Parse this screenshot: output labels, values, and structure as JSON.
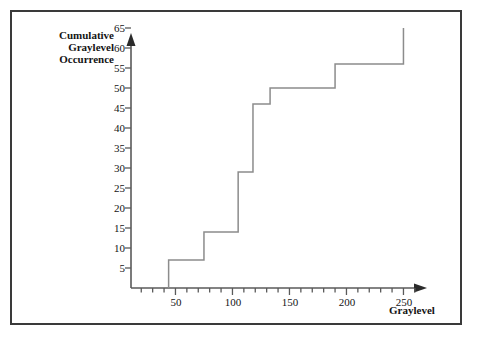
{
  "chart_data": {
    "type": "line",
    "subtype": "step-post",
    "title": "",
    "xlabel": "Graylevel",
    "ylabel": "Cumulative Graylevel Occurrence",
    "ylabel_lines": [
      "Cumulative",
      "Graylevel",
      "Occurrence"
    ],
    "xlim": [
      11,
      265
    ],
    "ylim": [
      0,
      67
    ],
    "x_major_ticks": [
      50,
      100,
      150,
      200,
      250
    ],
    "x_major_tick_labels": [
      "50",
      "100",
      "150",
      "200",
      "250"
    ],
    "x_minor_tick_interval": 10,
    "y_major_ticks": [
      5,
      10,
      15,
      20,
      25,
      30,
      35,
      40,
      45,
      50,
      55,
      60,
      65
    ],
    "y_major_tick_labels": [
      "5",
      "10",
      "15",
      "20",
      "25",
      "30",
      "35",
      "40",
      "45",
      "50",
      "55",
      "60",
      "65"
    ],
    "grid": false,
    "legend": false,
    "axis_arrows": true,
    "x": [
      44,
      75,
      105,
      118,
      133,
      190,
      250
    ],
    "values": [
      7,
      14,
      29,
      46,
      50,
      56,
      65
    ],
    "points": [
      {
        "graylevel": 44,
        "cumulative": 7
      },
      {
        "graylevel": 75,
        "cumulative": 14
      },
      {
        "graylevel": 105,
        "cumulative": 29
      },
      {
        "graylevel": 118,
        "cumulative": 46
      },
      {
        "graylevel": 133,
        "cumulative": 50
      },
      {
        "graylevel": 190,
        "cumulative": 56
      },
      {
        "graylevel": 250,
        "cumulative": 65
      }
    ],
    "line_color": "#8c8c8c",
    "axis_color": "#5a5a5a",
    "text_color": "#141414",
    "frame_color": "#3a3a3a",
    "background": "#ffffff"
  }
}
